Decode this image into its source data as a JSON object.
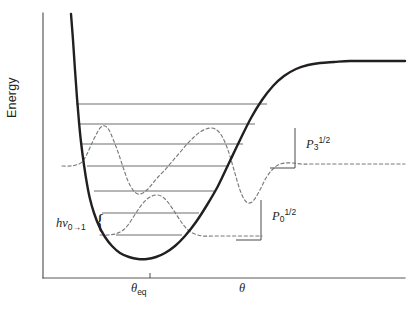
{
  "figure": {
    "type": "morse-potential-energy-diagram",
    "background_color": "#ffffff",
    "ink_color": "#231f20"
  },
  "axes": {
    "y_title": "Energy",
    "x_tick_label_main": "θ",
    "x_tick_sub_main": "eq",
    "x_axis_label": "θ",
    "y_axis": {
      "x": 43,
      "y_top": 13,
      "y_bottom": 278
    },
    "x_axis": {
      "y": 278,
      "x_left": 43,
      "x_right": 405
    },
    "theta_eq_tick_x": 150
  },
  "annotations": {
    "transition": {
      "h": "h",
      "nu": "ν",
      "sub": "0→1",
      "brace": "{"
    },
    "p3": {
      "base": "P",
      "sub": "3",
      "sup": "1/2"
    },
    "p0": {
      "base": "P",
      "sub": "0",
      "sup": "1/2"
    }
  },
  "chart_data": {
    "type": "line",
    "title": "",
    "xlabel": "θ",
    "ylabel": "Energy",
    "grid": false,
    "legend": null,
    "xlim": [
      43,
      405
    ],
    "ylim": [
      278,
      13
    ],
    "series": [
      {
        "name": "morse-potential-curve",
        "style": "solid",
        "color": "#231f20",
        "width": 2.4,
        "points": [
          [
            71,
            14
          ],
          [
            73,
            40
          ],
          [
            75,
            70
          ],
          [
            77,
            98
          ],
          [
            79,
            122
          ],
          [
            81,
            142
          ],
          [
            84,
            165
          ],
          [
            87,
            184
          ],
          [
            90,
            199
          ],
          [
            94,
            213
          ],
          [
            99,
            226
          ],
          [
            105,
            237
          ],
          [
            112,
            246
          ],
          [
            120,
            253
          ],
          [
            129,
            257
          ],
          [
            138,
            259
          ],
          [
            147,
            259
          ],
          [
            156,
            257
          ],
          [
            165,
            253
          ],
          [
            175,
            246
          ],
          [
            185,
            236
          ],
          [
            196,
            222
          ],
          [
            207,
            205
          ],
          [
            218,
            186
          ],
          [
            229,
            163
          ],
          [
            240,
            140
          ],
          [
            251,
            118
          ],
          [
            262,
            100
          ],
          [
            273,
            86
          ],
          [
            284,
            76
          ],
          [
            296,
            69
          ],
          [
            308,
            65
          ],
          [
            320,
            63
          ],
          [
            334,
            62
          ],
          [
            350,
            61
          ],
          [
            370,
            61
          ],
          [
            390,
            61
          ],
          [
            405,
            61
          ]
        ]
      },
      {
        "name": "vibrational-energy-levels",
        "style": "solid",
        "color": "#6d6e71",
        "width": 1.1,
        "levels": [
          {
            "index": 6,
            "y": 104,
            "x_start": 76,
            "x_end": 267
          },
          {
            "index": 5,
            "y": 124,
            "x_start": 79,
            "x_end": 255
          },
          {
            "index": 4,
            "y": 144,
            "x_start": 82,
            "x_end": 243
          },
          {
            "index": 3,
            "y": 166,
            "x_start": 87,
            "x_end": 229
          },
          {
            "index": 2,
            "y": 191,
            "x_start": 94,
            "x_end": 214
          },
          {
            "index": 1,
            "y": 213,
            "x_start": 102,
            "x_end": 199
          },
          {
            "index": 0,
            "y": 235,
            "x_start": 116,
            "x_end": 182
          }
        ]
      },
      {
        "name": "probability-density-p3",
        "style": "dashed",
        "color": "#7a7a7d",
        "width": 1.15,
        "baseline_y": 166,
        "points": [
          [
            62,
            166
          ],
          [
            70,
            166
          ],
          [
            76,
            165
          ],
          [
            82,
            162
          ],
          [
            87,
            154
          ],
          [
            92,
            143
          ],
          [
            97,
            133
          ],
          [
            101,
            127
          ],
          [
            105,
            126
          ],
          [
            109,
            130
          ],
          [
            113,
            139
          ],
          [
            118,
            152
          ],
          [
            123,
            167
          ],
          [
            128,
            181
          ],
          [
            133,
            190
          ],
          [
            138,
            194
          ],
          [
            143,
            193
          ],
          [
            148,
            189
          ],
          [
            153,
            183
          ],
          [
            158,
            177
          ],
          [
            164,
            171
          ],
          [
            170,
            164
          ],
          [
            176,
            157
          ],
          [
            182,
            150
          ],
          [
            188,
            143
          ],
          [
            194,
            137
          ],
          [
            200,
            132
          ],
          [
            206,
            129
          ],
          [
            212,
            128
          ],
          [
            218,
            131
          ],
          [
            223,
            138
          ],
          [
            228,
            150
          ],
          [
            232,
            163
          ],
          [
            236,
            177
          ],
          [
            240,
            190
          ],
          [
            244,
            199
          ],
          [
            248,
            203
          ],
          [
            252,
            202
          ],
          [
            256,
            197
          ],
          [
            261,
            188
          ],
          [
            266,
            178
          ],
          [
            272,
            170
          ],
          [
            278,
            165
          ],
          [
            285,
            163
          ],
          [
            293,
            163
          ],
          [
            302,
            164
          ],
          [
            312,
            164
          ],
          [
            325,
            164
          ],
          [
            340,
            164
          ],
          [
            358,
            164
          ],
          [
            375,
            164
          ],
          [
            392,
            164
          ],
          [
            405,
            164
          ]
        ]
      },
      {
        "name": "probability-density-p0",
        "style": "dashed",
        "color": "#7a7a7d",
        "width": 1.15,
        "baseline_y": 235,
        "points": [
          [
            100,
            235
          ],
          [
            108,
            235
          ],
          [
            115,
            234
          ],
          [
            122,
            231
          ],
          [
            128,
            225
          ],
          [
            134,
            216
          ],
          [
            140,
            207
          ],
          [
            146,
            200
          ],
          [
            152,
            196
          ],
          [
            158,
            195
          ],
          [
            164,
            198
          ],
          [
            170,
            205
          ],
          [
            176,
            214
          ],
          [
            182,
            223
          ],
          [
            188,
            230
          ],
          [
            195,
            234
          ],
          [
            203,
            236
          ],
          [
            212,
            236
          ],
          [
            222,
            236
          ],
          [
            232,
            236
          ],
          [
            242,
            236
          ],
          [
            252,
            236
          ],
          [
            262,
            236
          ]
        ]
      }
    ],
    "brackets": [
      {
        "name": "p3-scale-bracket",
        "vertical": {
          "x": 295,
          "y_top": 128,
          "y_bottom": 168
        },
        "horizontal": {
          "y": 168,
          "x_start": 270,
          "x_end": 295
        }
      },
      {
        "name": "p0-scale-bracket",
        "vertical": {
          "x": 261,
          "y_top": 200,
          "y_bottom": 240
        },
        "horizontal": {
          "y": 240,
          "x_start": 236,
          "x_end": 261
        }
      }
    ]
  }
}
